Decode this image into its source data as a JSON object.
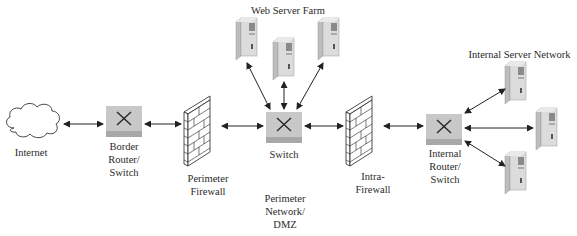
{
  "diagram": {
    "nodes": [
      {
        "id": "internet",
        "type": "cloud",
        "label": "Internet"
      },
      {
        "id": "border_router",
        "type": "router-switch",
        "label_lines": [
          "Border",
          "Router/",
          "Switch"
        ]
      },
      {
        "id": "perimeter_firewall",
        "type": "firewall",
        "label_lines": [
          "Perimeter",
          "Firewall"
        ]
      },
      {
        "id": "switch",
        "type": "switch",
        "label": "Switch"
      },
      {
        "id": "web_server_1",
        "type": "server"
      },
      {
        "id": "web_server_2",
        "type": "server"
      },
      {
        "id": "web_server_3",
        "type": "server"
      },
      {
        "id": "intra_firewall",
        "type": "firewall",
        "label_lines": [
          "Intra-",
          "Firewall"
        ]
      },
      {
        "id": "internal_router",
        "type": "router-switch",
        "label_lines": [
          "Internal",
          "Router/",
          "Switch"
        ]
      },
      {
        "id": "internal_server_1",
        "type": "server"
      },
      {
        "id": "internal_server_2",
        "type": "server"
      },
      {
        "id": "internal_server_3",
        "type": "server"
      }
    ],
    "groups": [
      {
        "id": "web_server_farm",
        "label": "Web Server Farm"
      },
      {
        "id": "internal_server_network",
        "label": "Internal Server Network"
      },
      {
        "id": "perimeter_network",
        "label_lines": [
          "Perimeter",
          "Network/",
          "DMZ"
        ]
      }
    ],
    "edges": [
      {
        "from": "internet",
        "to": "border_router",
        "style": "bidirectional-arrow"
      },
      {
        "from": "border_router",
        "to": "perimeter_firewall",
        "style": "bidirectional-arrow"
      },
      {
        "from": "perimeter_firewall",
        "to": "switch",
        "style": "bidirectional-arrow"
      },
      {
        "from": "switch",
        "to": "web_server_1",
        "style": "bidirectional-arrow"
      },
      {
        "from": "switch",
        "to": "web_server_2",
        "style": "bidirectional-arrow"
      },
      {
        "from": "switch",
        "to": "web_server_3",
        "style": "bidirectional-arrow"
      },
      {
        "from": "switch",
        "to": "intra_firewall",
        "style": "bidirectional-arrow"
      },
      {
        "from": "intra_firewall",
        "to": "internal_router",
        "style": "bidirectional-arrow"
      },
      {
        "from": "internal_router",
        "to": "internal_server_1",
        "style": "bidirectional-arrow"
      },
      {
        "from": "internal_router",
        "to": "internal_server_2",
        "style": "bidirectional-arrow"
      },
      {
        "from": "internal_router",
        "to": "internal_server_3",
        "style": "bidirectional-arrow"
      }
    ],
    "colors": {
      "switch_fill": "#c8c8c8",
      "switch_base": "#a8a8a8",
      "server_fill": "#d9d9d9",
      "line": "#222222",
      "text": "#2a2a2a"
    }
  },
  "labels": {
    "internet": "Internet",
    "border_router": [
      "Border",
      "Router/",
      "Switch"
    ],
    "perimeter_firewall": [
      "Perimeter",
      "Firewall"
    ],
    "switch": "Switch",
    "web_server_farm": "Web Server Farm",
    "perimeter_network": [
      "Perimeter",
      "Network/",
      "DMZ"
    ],
    "intra_firewall": [
      "Intra-",
      "Firewall"
    ],
    "internal_router": [
      "Internal",
      "Router/",
      "Switch"
    ],
    "internal_server_network": "Internal Server Network"
  }
}
